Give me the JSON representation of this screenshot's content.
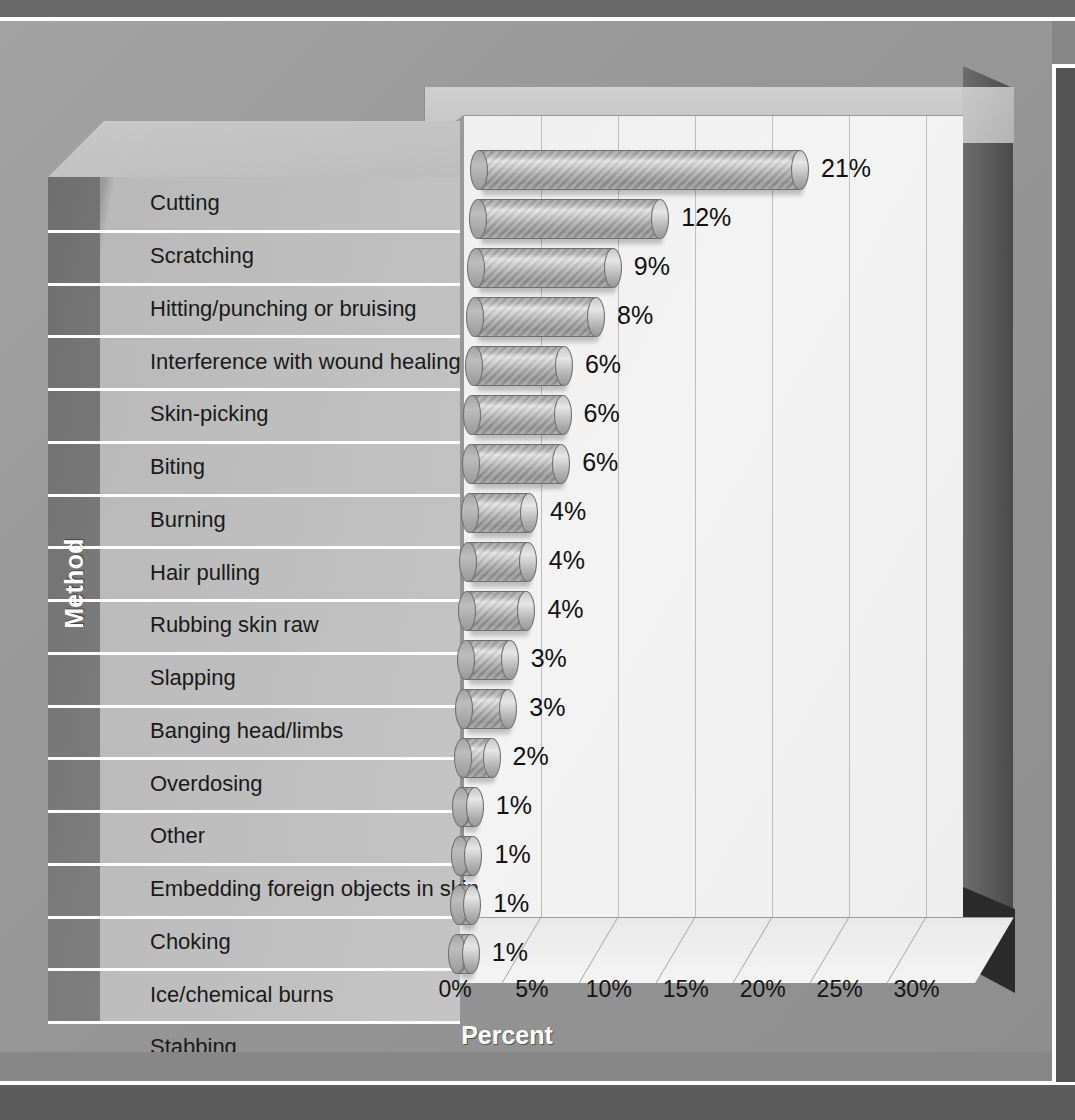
{
  "chart_data": {
    "type": "bar",
    "orientation": "horizontal",
    "title": "",
    "xlabel": "Percent",
    "ylabel": "Method",
    "xlim": [
      0,
      32.5
    ],
    "xtick_labels": [
      "0%",
      "5%",
      "10%",
      "15%",
      "20%",
      "25%",
      "30%"
    ],
    "xtick_values": [
      0,
      5,
      10,
      15,
      20,
      25,
      30
    ],
    "grid": true,
    "legend": false,
    "style": "3d-cylinder-bars",
    "categories": [
      "Cutting",
      "Scratching",
      "Hitting/punching or bruising",
      "Interference with wound healing",
      "Skin-picking",
      "Biting",
      "Burning",
      "Hair pulling",
      "Rubbing skin raw",
      "Slapping",
      "Banging head/limbs",
      "Overdosing",
      "Other",
      "Embedding foreign objects in skin",
      "Choking",
      "Ice/chemical burns",
      "Stabbing"
    ],
    "values": [
      21,
      12,
      9,
      8,
      6,
      6,
      6,
      4,
      4,
      4,
      3,
      3,
      2,
      1,
      1,
      1,
      1
    ],
    "data_labels": [
      "21%",
      "12%",
      "9%",
      "8%",
      "6%",
      "6%",
      "6%",
      "4%",
      "4%",
      "4%",
      "3%",
      "3%",
      "2%",
      "1%",
      "1%",
      "1%",
      "1%"
    ]
  },
  "axes": {
    "x_title": "Percent",
    "y_title": "Method"
  },
  "footer": {
    "text": ""
  },
  "colors": {
    "page_background": "#5a5a5a",
    "figure_background": "#9a9a9a",
    "plot_background": "#f2f2f2",
    "bar_fill": "#b4b4b4",
    "bar_outline": "#6f6f6f",
    "gridline": "#bdbdbd",
    "label_panel": "#c4c4c4",
    "axis_title_text": "#ffffff",
    "label_text": "#1a1a1a",
    "rule": "#fdfdfd"
  }
}
